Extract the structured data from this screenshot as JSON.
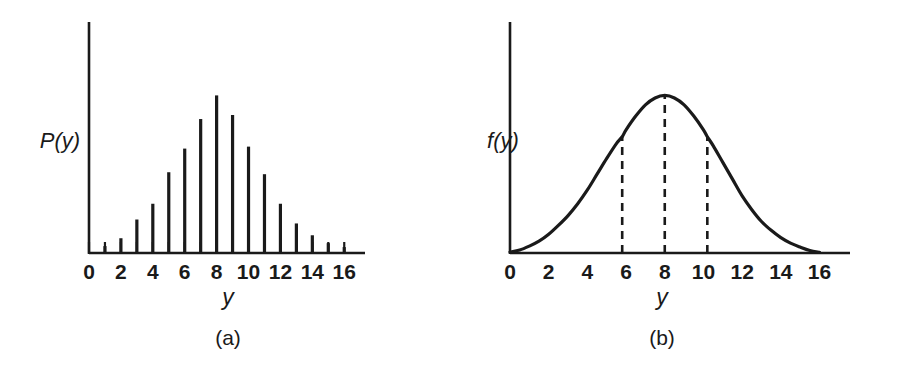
{
  "figure": {
    "background_color": "#ffffff",
    "ink_color": "#1a1a1a",
    "panels": [
      {
        "id": "a",
        "caption": "(a)",
        "y_axis_label": "P(y)",
        "x_axis_label": "y"
      },
      {
        "id": "b",
        "caption": "(b)",
        "y_axis_label": "f(y)",
        "x_axis_label": "y"
      }
    ]
  },
  "chart_data": [
    {
      "type": "bar",
      "panel": "a",
      "title": "",
      "subtitle": "",
      "xlabel": "y",
      "ylabel": "P(y)",
      "xlim": [
        0,
        16.8
      ],
      "ylim": [
        0,
        1.0
      ],
      "grid": false,
      "legend": "none",
      "axis_ticks_visible": true,
      "tick_interval": 1,
      "tick_labels_shown_at": [
        0,
        2,
        4,
        6,
        8,
        10,
        12,
        14,
        16
      ],
      "tick_labels": [
        "0",
        "2",
        "4",
        "6",
        "8",
        "10",
        "12",
        "14",
        "16"
      ],
      "categories": [
        1,
        2,
        3,
        4,
        5,
        6,
        7,
        8,
        9,
        10,
        11,
        12,
        13,
        14,
        15,
        16
      ],
      "values": [
        0.035,
        0.075,
        0.17,
        0.25,
        0.41,
        0.53,
        0.68,
        0.8,
        0.7,
        0.54,
        0.4,
        0.25,
        0.15,
        0.09,
        0.05,
        0.03
      ],
      "annotations": [
        "(a)"
      ]
    },
    {
      "type": "line",
      "panel": "b",
      "title": "",
      "subtitle": "",
      "xlabel": "y",
      "ylabel": "f(y)",
      "xlim": [
        0,
        16.8
      ],
      "ylim": [
        0,
        1.0
      ],
      "grid": false,
      "legend": "none",
      "axis_ticks_visible": false,
      "tick_labels_shown_at": [
        0,
        2,
        4,
        6,
        8,
        10,
        12,
        14,
        16
      ],
      "tick_labels": [
        "0",
        "2",
        "4",
        "6",
        "8",
        "10",
        "12",
        "14",
        "16"
      ],
      "curve_shape": "bell",
      "peak_x": 8,
      "peak_y": 0.8,
      "x": [
        0.0,
        0.5,
        1.0,
        1.5,
        2.0,
        2.5,
        3.0,
        3.5,
        4.0,
        4.5,
        5.0,
        5.5,
        5.8,
        6.0,
        6.5,
        7.0,
        7.5,
        8.0,
        8.5,
        9.0,
        9.5,
        10.0,
        10.2,
        10.5,
        11.0,
        11.5,
        12.0,
        12.5,
        13.0,
        13.5,
        14.0,
        14.5,
        15.0,
        15.5,
        16.0
      ],
      "y": [
        0.005,
        0.015,
        0.035,
        0.06,
        0.095,
        0.14,
        0.19,
        0.25,
        0.32,
        0.4,
        0.48,
        0.555,
        0.59,
        0.625,
        0.695,
        0.752,
        0.787,
        0.8,
        0.787,
        0.752,
        0.695,
        0.625,
        0.59,
        0.545,
        0.46,
        0.375,
        0.29,
        0.22,
        0.16,
        0.115,
        0.078,
        0.05,
        0.03,
        0.013,
        0.003
      ],
      "dashed_markers": [
        {
          "x": 5.8,
          "height_fraction": 0.74
        },
        {
          "x": 8.0,
          "height_fraction": 1.0
        },
        {
          "x": 10.2,
          "height_fraction": 0.74
        }
      ],
      "annotations": [
        "(b)"
      ]
    }
  ]
}
